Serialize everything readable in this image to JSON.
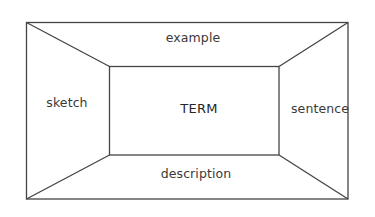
{
  "diagram": {
    "type": "frayer-model",
    "center": {
      "label": "TERM"
    },
    "panels": {
      "top": {
        "label": "example"
      },
      "left": {
        "label": "sketch"
      },
      "right": {
        "label": "sentence"
      },
      "bottom": {
        "label": "description"
      }
    },
    "colors": {
      "line": "#444444",
      "text": "#3a3a3a",
      "background": "#ffffff"
    }
  }
}
